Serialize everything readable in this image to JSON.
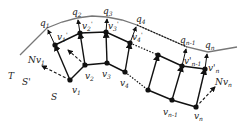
{
  "figure": {
    "surface_labels": {
      "target": "T",
      "offset": "S'",
      "source": "S"
    },
    "normal_labels": {
      "first": "Nv",
      "first_sub": "1",
      "last": "Nv",
      "last_sub": "n"
    },
    "q_labels": [
      {
        "base": "q",
        "sub": "1"
      },
      {
        "base": "q",
        "sub": "2"
      },
      {
        "base": "q",
        "sub": "3"
      },
      {
        "base": "q",
        "sub": "4"
      },
      {
        "base": "q",
        "sub": "n-1"
      },
      {
        "base": "q",
        "sub": "n"
      }
    ],
    "v_labels": [
      {
        "base": "v",
        "sub": "1"
      },
      {
        "base": "v",
        "sub": "2"
      },
      {
        "base": "v",
        "sub": "3"
      },
      {
        "base": "v",
        "sub": "4"
      },
      {
        "base": "v",
        "sub": "n-1"
      },
      {
        "base": "v",
        "sub": "n"
      }
    ],
    "vprime_labels": [
      {
        "base": "v",
        "sub": "1",
        "prime": "'"
      },
      {
        "base": "v",
        "sub": "2",
        "prime": "'"
      },
      {
        "base": "v",
        "sub": "3",
        "prime": "'"
      },
      {
        "base": "v",
        "sub": "4",
        "prime": "'"
      },
      {
        "base": "v'",
        "sub": "n-1",
        "prime": ""
      },
      {
        "base": "v'",
        "sub": "n",
        "prime": ""
      }
    ],
    "colors": {
      "surface": "#777777",
      "edges": "#111111"
    }
  }
}
